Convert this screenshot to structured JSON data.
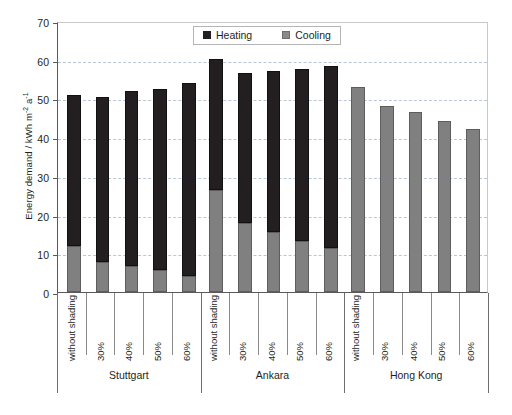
{
  "chart_data": {
    "type": "bar",
    "title": "",
    "subtitle": "",
    "stacked": true,
    "xlabel": "",
    "ylabel": "Energy demand / kWh m-2 a-1",
    "ylabel_parts": {
      "main": "Energy demand / kWh m",
      "sup1": "-2",
      "mid": " a",
      "sup2": "-1"
    },
    "ylim": [
      0,
      70
    ],
    "yticks": [
      0,
      10,
      20,
      30,
      40,
      50,
      60,
      70
    ],
    "ytick_labels": [
      "0",
      "10",
      "20",
      "30",
      "40",
      "50",
      "60",
      "70"
    ],
    "grid": "horizontal-dashed",
    "legend_position": "top-center",
    "legend": [
      "Heating",
      "Cooling"
    ],
    "colors": {
      "heating": "#231f20",
      "cooling": "#808080",
      "grid": "#b9c6d8",
      "axis": "#5a5a5a"
    },
    "groups": [
      {
        "name": "Stuttgart",
        "categories": [
          "without shading",
          "30%",
          "40%",
          "50%",
          "60%"
        ]
      },
      {
        "name": "Ankara",
        "categories": [
          "without shading",
          "30%",
          "40%",
          "50%",
          "60%"
        ]
      },
      {
        "name": "Hong Kong",
        "categories": [
          "without shading",
          "30%",
          "40%",
          "50%",
          "60%"
        ]
      }
    ],
    "categories": [
      "without shading",
      "30%",
      "40%",
      "50%",
      "60%",
      "without shading",
      "30%",
      "40%",
      "50%",
      "60%",
      "without shading",
      "30%",
      "40%",
      "50%",
      "60%"
    ],
    "series": [
      {
        "name": "Cooling",
        "values": [
          11.8,
          7.7,
          6.8,
          5.6,
          4.2,
          26.3,
          17.8,
          15.5,
          13.2,
          11.3,
          53.0,
          48.0,
          46.5,
          44.3,
          42.0
        ]
      },
      {
        "name": "Heating",
        "values": [
          39.2,
          42.8,
          45.0,
          46.9,
          49.8,
          33.9,
          38.7,
          41.5,
          44.5,
          47.0,
          0.0,
          0.0,
          0.0,
          0.0,
          0.0
        ]
      }
    ],
    "totals": [
      51.0,
      50.5,
      51.8,
      52.5,
      54.0,
      60.2,
      56.5,
      57.0,
      57.7,
      58.3,
      53.0,
      48.0,
      46.5,
      44.3,
      42.0
    ]
  },
  "legend": {
    "heating_label": "Heating",
    "cooling_label": "Cooling"
  },
  "axis": {
    "y_title_main": "Energy demand / kWh m",
    "y_title_sup1": "-2",
    "y_title_mid": " a",
    "y_title_sup2": "-1"
  }
}
